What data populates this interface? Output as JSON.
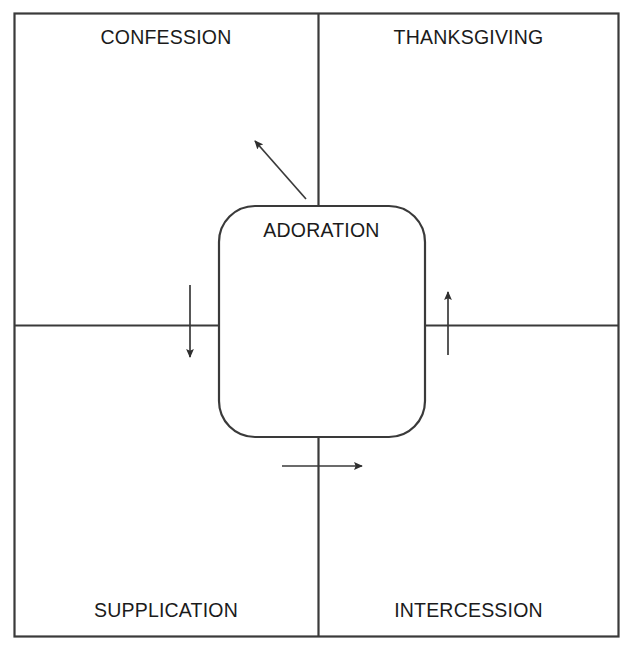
{
  "figure": {
    "type": "quadrant-diagram",
    "clipped_top_text": "",
    "center": {
      "label": "ADORATION"
    },
    "quadrants": [
      {
        "position": "top-left",
        "label": "CONFESSION"
      },
      {
        "position": "top-right",
        "label": "THANKSGIVING"
      },
      {
        "position": "bottom-left",
        "label": "SUPPLICATION"
      },
      {
        "position": "bottom-right",
        "label": "INTERCESSION"
      }
    ],
    "arrows": [
      {
        "name": "arrow-to-confession",
        "direction": "up-left",
        "target": "CONFESSION"
      },
      {
        "name": "arrow-to-supplication",
        "direction": "down",
        "target": "SUPPLICATION"
      },
      {
        "name": "arrow-to-thanksgiving",
        "direction": "up",
        "target": "THANKSGIVING"
      },
      {
        "name": "arrow-to-intercession",
        "direction": "right",
        "target": "INTERCESSION"
      }
    ],
    "colors": {
      "stroke": "#3a3a3a",
      "text": "#1b1b1b",
      "background": "#ffffff"
    }
  }
}
